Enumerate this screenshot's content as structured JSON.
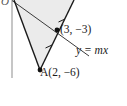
{
  "figure": {
    "background_color": "#ffffff",
    "shade_color": "#ebebeb",
    "line_color": "#1a1a1a",
    "axis_color": "#b8b8b8",
    "width": 127,
    "height": 106
  },
  "axes": {
    "origin_label": "O",
    "y_axis": {
      "x": 12,
      "y_top": 0,
      "y_bottom": 78
    }
  },
  "labels": {
    "point_b": "(3, −3)",
    "line_equation": "y = mx",
    "point_a": "A(2, −6)"
  },
  "points": [
    {
      "name": "B",
      "label": "(3, −3)",
      "coords": [
        3,
        -3
      ],
      "px": [
        57,
        30
      ],
      "marker": "filled-dot"
    },
    {
      "name": "A",
      "label": "A(2, −6)",
      "coords": [
        2,
        -6
      ],
      "px": [
        40,
        70
      ],
      "marker": "filled-dot"
    }
  ],
  "lines": [
    {
      "name": "y-equals-mx",
      "label": "y = mx",
      "from_px": [
        12,
        1
      ],
      "to_px": [
        88,
        55
      ]
    },
    {
      "name": "triangle-left-side",
      "from_px": [
        14,
        0
      ],
      "to_px": [
        40,
        70
      ]
    },
    {
      "name": "triangle-right-side",
      "from_px": [
        40,
        70
      ],
      "to_px": [
        74,
        0
      ]
    }
  ],
  "shaded_region": {
    "name": "triangle-OAB-shade",
    "vertices_px": [
      [
        14,
        0
      ],
      [
        40,
        70
      ],
      [
        74,
        0
      ]
    ],
    "color": "#ebebeb"
  },
  "tick_marks": [
    {
      "name": "congruence-tick-upper",
      "on_line": "triangle-right-side",
      "px": [
        62,
        17
      ]
    },
    {
      "name": "congruence-tick-lower",
      "on_line": "triangle-right-side",
      "px": [
        50,
        45
      ]
    }
  ]
}
